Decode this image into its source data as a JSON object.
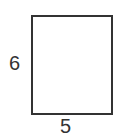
{
  "diagram": {
    "shape": "rectangle",
    "labels": {
      "height": "6",
      "width": "5"
    },
    "stroke_color": "#333333"
  }
}
